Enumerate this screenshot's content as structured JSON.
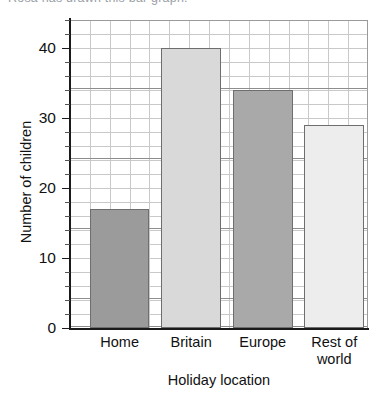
{
  "top_fragment": "Rosa has drawn this bar graph.",
  "chart_data": {
    "type": "bar",
    "title": "",
    "xlabel": "Holiday location",
    "ylabel": "Number of children",
    "categories": [
      "Home",
      "Britain",
      "Europe",
      "Rest of world"
    ],
    "values": [
      17,
      40,
      34,
      29
    ],
    "ylim": [
      0,
      44
    ],
    "yticks": [
      0,
      10,
      20,
      30,
      40
    ],
    "ytick_labels": [
      "0",
      "10",
      "20",
      "30",
      "40"
    ],
    "minor_tick_step": 2,
    "grid": true,
    "legend": "none",
    "bar_colors": [
      "#9b9b9b",
      "#d9d9d9",
      "#a9a9a9",
      "#ededed"
    ],
    "bar_border_color": "#6e6e6e",
    "grid_color": "#c9c9c9",
    "axis_color": "#1a1a1a"
  }
}
